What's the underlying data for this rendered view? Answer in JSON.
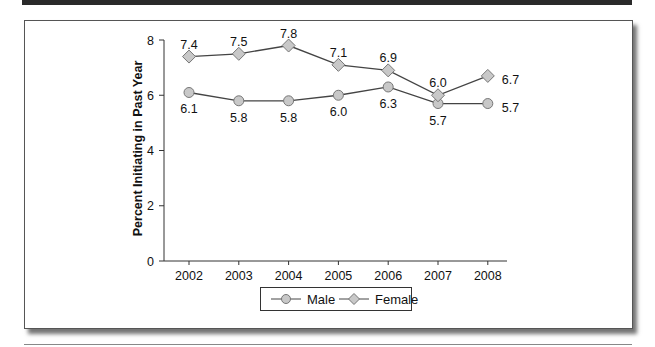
{
  "chart_data": {
    "type": "line",
    "title": "",
    "xlabel": "",
    "ylabel": "Percent Initiating in Past Year",
    "ylim": [
      0,
      8
    ],
    "yticks": [
      0,
      2,
      4,
      6,
      8
    ],
    "grid": false,
    "legend_position": "bottom",
    "categories": [
      "2002",
      "2003",
      "2004",
      "2005",
      "2006",
      "2007",
      "2008"
    ],
    "series": [
      {
        "name": "Male",
        "marker": "circle",
        "values": [
          6.1,
          5.8,
          5.8,
          6.0,
          6.3,
          5.7,
          5.7
        ],
        "labels": [
          "6.1",
          "5.8",
          "5.8",
          "6.0",
          "6.3",
          "5.7",
          "5.7"
        ]
      },
      {
        "name": "Female",
        "marker": "diamond",
        "values": [
          7.4,
          7.5,
          7.8,
          7.1,
          6.9,
          6.0,
          6.7
        ],
        "labels": [
          "7.4",
          "7.5",
          "7.8",
          "7.1",
          "6.9",
          "6.0",
          "6.7"
        ]
      }
    ]
  },
  "legend": {
    "male_label": "Male",
    "female_label": "Female"
  },
  "colors": {
    "line": "#444444",
    "marker_fill": "#c8c8c8",
    "marker_stroke": "#777777",
    "frame": "#555555"
  }
}
